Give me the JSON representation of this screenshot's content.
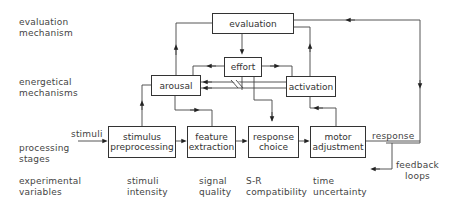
{
  "row_labels": {
    "evaluation": [
      "evaluation",
      "mechanism"
    ],
    "energetical": [
      "energetical",
      "mechanisms"
    ],
    "processing": [
      "processing",
      "stages"
    ],
    "experimental": [
      "experimental",
      "variables"
    ]
  },
  "boxes": {
    "evaluation": "evaluation",
    "effort": "effort",
    "arousal": "arousal",
    "activation": "activation",
    "stimulus_preprocessing": [
      "stimulus",
      "preprocessing"
    ],
    "feature_extraction": [
      "feature",
      "extraction"
    ],
    "response_choice": [
      "response",
      "choice"
    ],
    "motor_adjustment": [
      "motor",
      "adjustment"
    ]
  },
  "flow_labels": {
    "input": "stimuli",
    "output": "response",
    "feedback": [
      "feedback",
      "loops"
    ]
  },
  "variables": [
    [
      "stimuli",
      "intensity"
    ],
    [
      "signal",
      "quality"
    ],
    [
      "S-R",
      "compatibility"
    ],
    [
      "time",
      "uncertainty"
    ]
  ]
}
